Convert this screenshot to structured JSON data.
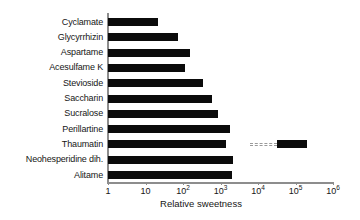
{
  "chart_data": {
    "type": "bar",
    "orientation": "horizontal",
    "title": "",
    "subtitle": "",
    "xlabel": "Relative sweetness",
    "ylabel": "",
    "xscale": "log",
    "xlim": [
      1,
      1000000
    ],
    "grid": false,
    "legend": null,
    "bar_color": "#0b0b0b",
    "axis_color": "#8d8d8d",
    "categories": [
      "Cyclamate",
      "Glycyrrhizin",
      "Aspartame",
      "Acesulfame K",
      "Stevioside",
      "Saccharin",
      "Sucralose",
      "Perillartine",
      "Thaumatin",
      "Neohesperidine dih.",
      "Alitame"
    ],
    "values": [
      21,
      74,
      155,
      110,
      340,
      590,
      850,
      1800,
      1400,
      2200,
      2000
    ],
    "xtick_labels": [
      "1",
      "10",
      "10²",
      "10³",
      "10⁴",
      "10⁵",
      "10⁶"
    ],
    "xtick_values": [
      1,
      10,
      100,
      1000,
      10000,
      100000,
      1000000
    ],
    "xtick_bases": [
      "1",
      "10",
      "10",
      "10",
      "10",
      "10",
      "10"
    ],
    "xtick_exponents": [
      "",
      "",
      "2",
      "3",
      "4",
      "5",
      "6"
    ],
    "broken_bars": [
      {
        "category": "Thaumatin",
        "segment_end": 1400,
        "gap_start": 6000,
        "gap_end": 33000,
        "cap_end": 200000,
        "note": "axis break — bar continues to ~2×10⁵"
      }
    ],
    "annotations": []
  }
}
